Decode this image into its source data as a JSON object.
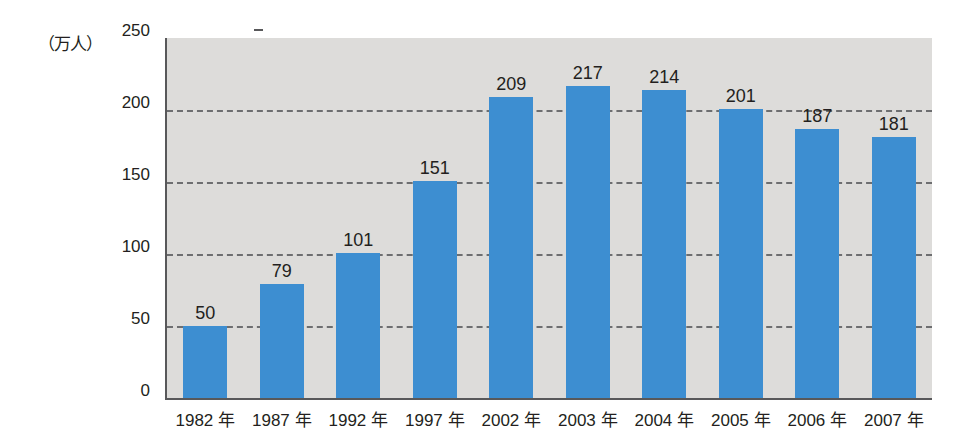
{
  "chart_data": {
    "type": "bar",
    "title": "",
    "subtitle": "",
    "xlabel": "",
    "ylabel": "（万人）",
    "categories": [
      "1982 年",
      "1987 年",
      "1992 年",
      "1997 年",
      "2002 年",
      "2003 年",
      "2004 年",
      "2005 年",
      "2006 年",
      "2007 年"
    ],
    "values": [
      50,
      79,
      101,
      151,
      209,
      217,
      214,
      201,
      187,
      181
    ],
    "value_labels": [
      "50",
      "79",
      "101",
      "151",
      "209",
      "217",
      "214",
      "201",
      "187",
      "181"
    ],
    "ylim": [
      0,
      250
    ],
    "ytick_labels": [
      "0",
      "50",
      "100",
      "150",
      "200",
      "250"
    ],
    "ytick_values": [
      0,
      50,
      100,
      150,
      200,
      250
    ],
    "grid": "horizontal-dashed",
    "gridline_values": [
      50,
      100,
      150,
      200
    ],
    "legend": "none",
    "legend_position": "none",
    "bar_color": "#3d8ed1",
    "plot_background": "#dddcda",
    "axis_color": "#58585a",
    "gridline_color": "#6d6e70",
    "text_color": "#231f20",
    "page_background": "#ffffff"
  }
}
